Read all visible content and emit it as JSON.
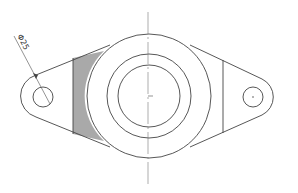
{
  "drawing": {
    "type": "flange-top-view",
    "dimension": {
      "label": "Φ25",
      "target": "left-mounting-hole"
    },
    "colors": {
      "outline": "#444444",
      "shaded_region": "#a9a9a9",
      "background": "#ffffff"
    }
  }
}
